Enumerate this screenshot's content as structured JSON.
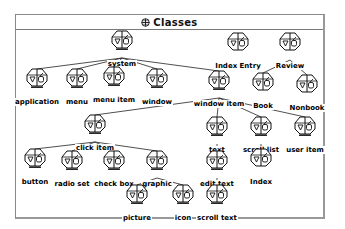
{
  "window": {
    "title": "Classes",
    "title_icon": "classes-globe-icon"
  },
  "nodes": [
    {
      "id": "system",
      "label": "system",
      "x": 122,
      "y": 30,
      "bars": 1
    },
    {
      "id": "index-entry",
      "label": "Index Entry",
      "x": 238,
      "y": 32,
      "bars": 0
    },
    {
      "id": "review",
      "label": "Review",
      "x": 290,
      "y": 32,
      "bars": 0
    },
    {
      "id": "application",
      "label": "application",
      "x": 37,
      "y": 68,
      "bars": 1
    },
    {
      "id": "menu",
      "label": "menu",
      "x": 77,
      "y": 68,
      "bars": 1
    },
    {
      "id": "menu-item",
      "label": "menu item",
      "x": 114,
      "y": 66,
      "bars": 1
    },
    {
      "id": "window",
      "label": "window",
      "x": 157,
      "y": 68,
      "bars": 1
    },
    {
      "id": "window-item",
      "label": "window item",
      "x": 219,
      "y": 70,
      "bars": 1
    },
    {
      "id": "book",
      "label": "Book",
      "x": 263,
      "y": 72,
      "bars": 0
    },
    {
      "id": "nonbook",
      "label": "Nonbook",
      "x": 307,
      "y": 74,
      "bars": 0
    },
    {
      "id": "click-item",
      "label": "click item",
      "x": 95,
      "y": 114,
      "bars": 1
    },
    {
      "id": "text",
      "label": "text",
      "x": 217,
      "y": 116,
      "bars": 1
    },
    {
      "id": "scroll-list",
      "label": "scroll list",
      "x": 261,
      "y": 116,
      "bars": 1
    },
    {
      "id": "user-item",
      "label": "user item",
      "x": 305,
      "y": 116,
      "bars": 1
    },
    {
      "id": "button",
      "label": "button",
      "x": 35,
      "y": 148,
      "bars": 1
    },
    {
      "id": "radio-set",
      "label": "radio set",
      "x": 72,
      "y": 150,
      "bars": 1
    },
    {
      "id": "check-box",
      "label": "check box",
      "x": 114,
      "y": 150,
      "bars": 1
    },
    {
      "id": "graphic",
      "label": "graphic",
      "x": 157,
      "y": 150,
      "bars": 1
    },
    {
      "id": "edit-text",
      "label": "edit text",
      "x": 217,
      "y": 150,
      "bars": 1
    },
    {
      "id": "index",
      "label": "Index",
      "x": 261,
      "y": 148,
      "bars": 0
    },
    {
      "id": "picture",
      "label": "picture",
      "x": 137,
      "y": 184,
      "bars": 1
    },
    {
      "id": "icon",
      "label": "icon",
      "x": 183,
      "y": 184,
      "bars": 1
    },
    {
      "id": "scroll-text",
      "label": "scroll text",
      "x": 217,
      "y": 184,
      "bars": 1
    }
  ],
  "edges": [
    [
      "system",
      "application"
    ],
    [
      "system",
      "menu"
    ],
    [
      "system",
      "menu-item"
    ],
    [
      "system",
      "window"
    ],
    [
      "system",
      "window-item"
    ],
    [
      "review",
      "book"
    ],
    [
      "review",
      "nonbook"
    ],
    [
      "window-item",
      "click-item"
    ],
    [
      "window-item",
      "text"
    ],
    [
      "window-item",
      "scroll-list"
    ],
    [
      "window-item",
      "user-item"
    ],
    [
      "click-item",
      "button"
    ],
    [
      "click-item",
      "radio-set"
    ],
    [
      "click-item",
      "check-box"
    ],
    [
      "click-item",
      "graphic"
    ],
    [
      "graphic",
      "picture"
    ],
    [
      "graphic",
      "icon"
    ],
    [
      "text",
      "edit-text"
    ],
    [
      "edit-text",
      "scroll-text"
    ],
    [
      "scroll-list",
      "index"
    ]
  ]
}
